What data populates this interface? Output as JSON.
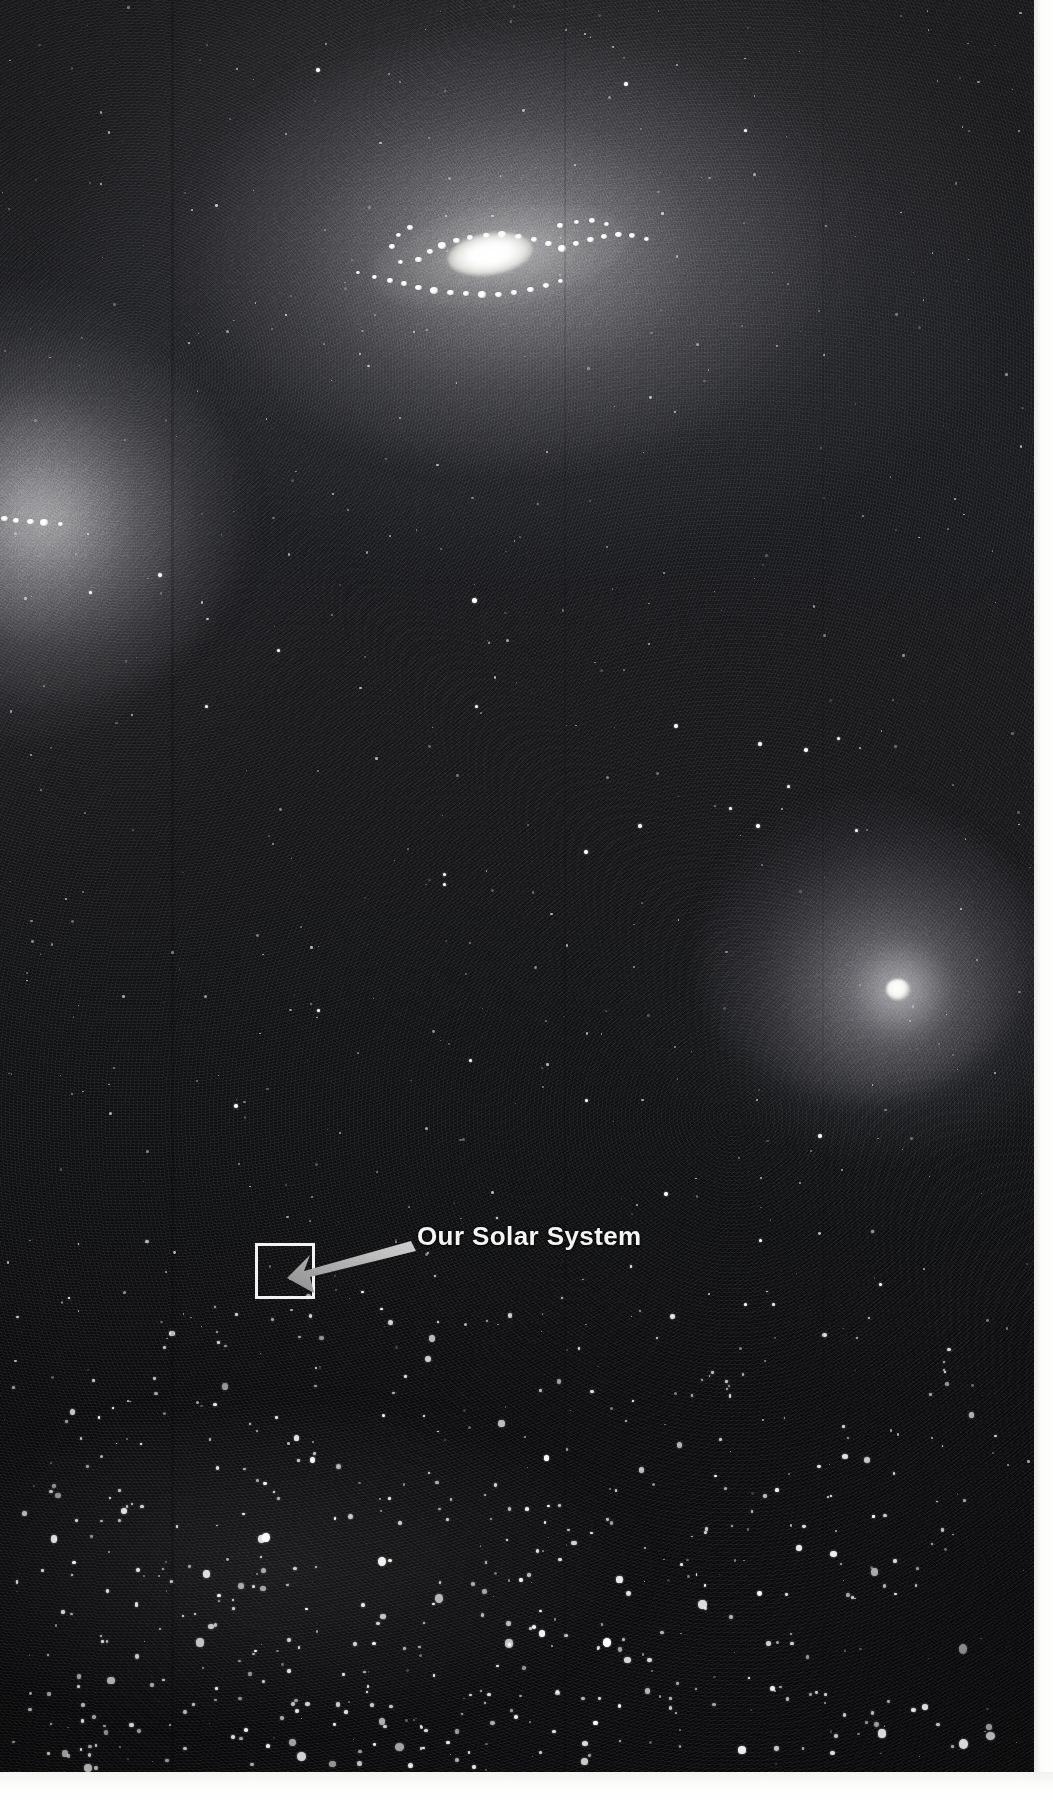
{
  "image": {
    "kind": "astronomical-photograph",
    "medium": "black-and-white photographic plate",
    "width_px": 1053,
    "height_px": 1807,
    "plate_width_px": 1034,
    "plate_height_px": 1772,
    "background_color": "#0a0a0c",
    "paper_border_color": "#ffffff"
  },
  "annotation": {
    "label": "Our Solar System",
    "label_color": "#f4f4f2",
    "label_left_px": 417,
    "label_top_px": 1221,
    "marker_box": {
      "name": "solar-system-locator-box",
      "stroke_color": "#f2f2f2",
      "stroke_width_px": 3,
      "left_px": 255,
      "top_px": 1243,
      "width_px": 60,
      "height_px": 56
    },
    "arrow": {
      "name": "pointer-arrow",
      "color": "#b9b9b9",
      "tail_x": 410,
      "tail_y": 1243,
      "tip_x": 287,
      "tip_y": 1278,
      "direction": "right-to-left, downward"
    }
  },
  "objects": [
    {
      "id": "galaxy-main",
      "name": "Main barred spiral galaxy",
      "center_x_px": 490,
      "center_y_px": 254,
      "appearance": "bright elongated nucleus with knotted spiral arms and broad diffuse halo",
      "core_color": "#ffffff",
      "halo_color": "#8a8a8e"
    },
    {
      "id": "galaxy-left",
      "name": "Edge-cropped galaxy at left margin",
      "center_x_px": 20,
      "center_y_px": 520,
      "appearance": "diffuse glow cut off by the frame with a chain of bright knots",
      "core_color": "#f6f6f4",
      "halo_color": "#9a9a9e"
    },
    {
      "id": "galaxy-right",
      "name": "Elliptical galaxy lower right",
      "center_x_px": 898,
      "center_y_px": 989,
      "appearance": "compact bright nucleus inside a round diffuse envelope",
      "core_color": "#ffffff",
      "halo_color": "#7c7c82"
    },
    {
      "id": "star-cluster-bottom",
      "name": "Dense foreground star field",
      "center_x_px": 300,
      "center_y_px": 1480,
      "appearance": "thousands of resolved point sources concentrating toward the lower left"
    }
  ],
  "chart_data": {
    "type": "scatter",
    "title": "Our Solar System",
    "xlabel": "",
    "ylabel": "",
    "xlim": [
      0,
      1034
    ],
    "ylim": [
      0,
      1772
    ],
    "grid": false,
    "legend": "none",
    "annotations": [
      {
        "text": "Our Solar System",
        "x": 417,
        "y": 1243,
        "arrow_to_x": 287,
        "arrow_to_y": 1278
      }
    ],
    "series": [
      {
        "name": "galaxy-main-arm-knots",
        "points": [
          [
            418,
            260,
            7
          ],
          [
            430,
            252,
            6
          ],
          [
            442,
            246,
            8
          ],
          [
            456,
            241,
            7
          ],
          [
            470,
            238,
            6
          ],
          [
            486,
            236,
            7
          ],
          [
            502,
            235,
            8
          ],
          [
            518,
            237,
            7
          ],
          [
            534,
            240,
            6
          ],
          [
            548,
            244,
            7
          ],
          [
            562,
            249,
            8
          ],
          [
            576,
            244,
            6
          ],
          [
            590,
            240,
            7
          ],
          [
            604,
            237,
            6
          ],
          [
            618,
            235,
            7
          ],
          [
            632,
            236,
            6
          ],
          [
            646,
            239,
            5
          ],
          [
            404,
            284,
            6
          ],
          [
            418,
            288,
            7
          ],
          [
            434,
            291,
            8
          ],
          [
            450,
            293,
            7
          ],
          [
            466,
            294,
            6
          ],
          [
            482,
            295,
            8
          ],
          [
            498,
            295,
            7
          ],
          [
            514,
            293,
            6
          ],
          [
            530,
            290,
            7
          ],
          [
            546,
            286,
            6
          ],
          [
            560,
            281,
            5
          ],
          [
            390,
            281,
            6
          ],
          [
            374,
            277,
            5
          ],
          [
            358,
            273,
            4
          ],
          [
            410,
            228,
            6
          ],
          [
            398,
            235,
            5
          ],
          [
            392,
            247,
            6
          ],
          [
            400,
            262,
            5
          ],
          [
            560,
            226,
            6
          ],
          [
            576,
            222,
            5
          ],
          [
            592,
            221,
            6
          ],
          [
            606,
            224,
            5
          ]
        ]
      },
      {
        "name": "galaxy-left-knots",
        "points": [
          [
            4,
            519,
            7
          ],
          [
            16,
            521,
            6
          ],
          [
            30,
            522,
            7
          ],
          [
            44,
            523,
            8
          ],
          [
            60,
            524,
            5
          ]
        ]
      },
      {
        "name": "bright-field-stars",
        "points": [
          [
            318,
            70,
            4
          ],
          [
            626,
            84,
            4
          ],
          [
            745,
            130,
            3
          ],
          [
            160,
            575,
            4
          ],
          [
            90,
            592,
            3
          ],
          [
            474,
            600,
            5
          ],
          [
            278,
            650,
            3
          ],
          [
            206,
            706,
            3
          ],
          [
            476,
            706,
            3
          ],
          [
            676,
            726,
            4
          ],
          [
            760,
            744,
            4
          ],
          [
            806,
            750,
            4
          ],
          [
            838,
            738,
            3
          ],
          [
            788,
            786,
            3
          ],
          [
            640,
            826,
            4
          ],
          [
            586,
            852,
            4
          ],
          [
            444,
            874,
            3
          ],
          [
            444,
            884,
            3
          ],
          [
            758,
            826,
            4
          ],
          [
            730,
            808,
            3
          ],
          [
            856,
            830,
            3
          ],
          [
            318,
            1010,
            3
          ],
          [
            236,
            1106,
            4
          ],
          [
            470,
            1060,
            3
          ],
          [
            586,
            1100,
            3
          ],
          [
            820,
            1136,
            4
          ],
          [
            666,
            1194,
            4
          ],
          [
            760,
            1240,
            3
          ],
          [
            880,
            1284,
            3
          ]
        ]
      },
      {
        "name": "cluster-stars-bottom",
        "description": "dense resolved star field occupying the lower quarter of the plate",
        "approx_count": 420
      }
    ]
  }
}
